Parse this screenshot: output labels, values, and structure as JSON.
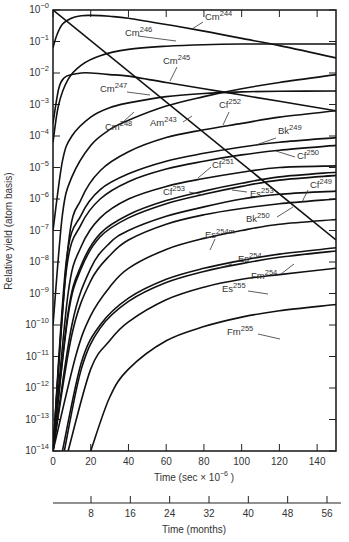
{
  "chart_data": {
    "type": "line",
    "title": "",
    "xlabel": "Time (sec × 10⁻⁶ )",
    "xlabel_parts": {
      "main": "Time (sec × 10",
      "exp": "−6",
      "tail": " )"
    },
    "ylabel": "Relative yield (atom basis)",
    "secondary_xlabel": "Time (months)",
    "yscale": "log",
    "xlim": [
      0,
      150
    ],
    "ylim_log10": [
      -14,
      0
    ],
    "x_ticks": [
      0,
      20,
      40,
      60,
      80,
      100,
      120,
      140
    ],
    "y_ticks_log10": [
      0,
      -1,
      -2,
      -3,
      -4,
      -5,
      -6,
      -7,
      -8,
      -9,
      -10,
      -11,
      -12,
      -13,
      -14
    ],
    "y_tick_labels": [
      "10⁻⁰",
      "10⁻¹",
      "10⁻²",
      "10⁻³",
      "10⁻⁴",
      "10⁻⁵",
      "10⁻⁶",
      "10⁻⁷",
      "10⁻⁸",
      "10⁻⁹",
      "10⁻¹⁰",
      "10⁻¹¹",
      "10⁻¹²",
      "10⁻¹³",
      "10⁻¹⁴"
    ],
    "secondary_x_ticks": [
      8,
      16,
      24,
      32,
      40,
      48,
      56
    ],
    "grid": false,
    "legend": "inline labels",
    "series": [
      {
        "name": "Cm244",
        "label_base": "Cm",
        "label_mass": "244",
        "x": [
          0,
          2,
          5,
          10,
          15,
          20,
          30,
          40,
          60,
          80,
          100,
          120,
          150
        ],
        "log10_y": [
          -1.2,
          -0.8,
          -0.45,
          -0.25,
          -0.18,
          -0.17,
          -0.2,
          -0.26,
          -0.46,
          -0.67,
          -0.9,
          -1.13,
          -1.52
        ],
        "label_pos": [
          205,
          20
        ],
        "leader": [
          [
            203,
            22
          ],
          [
            192,
            29
          ]
        ]
      },
      {
        "name": "Cm246",
        "label_base": "Cm",
        "label_mass": "246",
        "x": [
          0,
          3,
          8,
          15,
          25,
          40,
          60,
          80,
          100,
          120,
          150
        ],
        "log10_y": [
          -4.2,
          -3.0,
          -2.2,
          -1.75,
          -1.45,
          -1.25,
          -1.15,
          -1.1,
          -1.08,
          -1.08,
          -1.08
        ],
        "label_pos": [
          125,
          36
        ],
        "leader": [
          [
            138,
            36
          ],
          [
            176,
            41
          ]
        ]
      },
      {
        "name": "Cm245",
        "label_base": "Cm",
        "label_mass": "245",
        "x": [
          0,
          3,
          6,
          10,
          15,
          20,
          30,
          40,
          60,
          80,
          100,
          120,
          150
        ],
        "log10_y": [
          -3.6,
          -2.5,
          -2.15,
          -2.05,
          -2.0,
          -2.0,
          -2.05,
          -2.1,
          -2.3,
          -2.5,
          -2.7,
          -2.9,
          -3.2
        ],
        "label_pos": [
          163,
          64
        ],
        "leader": [
          [
            177,
            67
          ],
          [
            170,
            81
          ]
        ]
      },
      {
        "name": "Cm247",
        "label_base": "Cm",
        "label_mass": "247",
        "x": [
          0,
          5,
          10,
          20,
          30,
          40,
          60,
          80,
          100,
          120,
          150
        ],
        "log10_y": [
          -7.0,
          -4.8,
          -4.0,
          -3.4,
          -3.1,
          -2.95,
          -2.75,
          -2.65,
          -2.6,
          -2.58,
          -2.57
        ],
        "label_pos": [
          100,
          92
        ],
        "leader": [
          [
            127,
            92
          ],
          [
            150,
            95
          ]
        ]
      },
      {
        "name": "Cm248",
        "label_base": "Cm",
        "label_mass": "248",
        "x": [
          0,
          5,
          10,
          20,
          30,
          40,
          60,
          80,
          100,
          120,
          150
        ],
        "log10_y": [
          -10.0,
          -6.5,
          -5.3,
          -4.3,
          -3.8,
          -3.5,
          -3.05,
          -2.75,
          -2.5,
          -2.3,
          -2.05
        ],
        "label_pos": [
          105,
          130
        ],
        "leader": [
          [
            123,
            122
          ],
          [
            134,
            112
          ]
        ]
      },
      {
        "name": "Am243",
        "label_base": "Am",
        "label_mass": "243",
        "x": [
          0,
          150
        ],
        "log10_y": [
          0.0,
          -7.3
        ],
        "label_pos": [
          150,
          126
        ],
        "leader": [
          [
            183,
            122
          ],
          [
            192,
            116
          ]
        ]
      },
      {
        "name": "Cf252",
        "label_base": "Cf",
        "label_mass": "252",
        "x": [
          0,
          8,
          15,
          25,
          40,
          60,
          80,
          100,
          120,
          150
        ],
        "log10_y": [
          -14,
          -7.5,
          -6.0,
          -5.1,
          -4.5,
          -4.05,
          -3.8,
          -3.6,
          -3.4,
          -3.2
        ],
        "label_pos": [
          219,
          108
        ],
        "leader": [
          [
            229,
            112
          ],
          [
            223,
            125
          ]
        ]
      },
      {
        "name": "Bk249",
        "label_base": "Bk",
        "label_mass": "249",
        "x": [
          0,
          7,
          15,
          25,
          40,
          60,
          80,
          100,
          120,
          150
        ],
        "log10_y": [
          -14,
          -8.0,
          -6.5,
          -5.7,
          -5.2,
          -4.8,
          -4.55,
          -4.35,
          -4.2,
          -4.05
        ],
        "label_pos": [
          278,
          134
        ],
        "leader": [
          [
            276,
            138
          ],
          [
            256,
            145
          ]
        ]
      },
      {
        "name": "Cf250",
        "label_base": "Cf",
        "label_mass": "250",
        "x": [
          0,
          7,
          15,
          25,
          40,
          60,
          80,
          100,
          120,
          150
        ],
        "log10_y": [
          -14,
          -8.3,
          -6.8,
          -6.0,
          -5.45,
          -5.05,
          -4.8,
          -4.6,
          -4.45,
          -4.3
        ],
        "label_pos": [
          297,
          159
        ],
        "leader": [
          [
            295,
            157
          ],
          [
            276,
            151
          ]
        ]
      },
      {
        "name": "Cf251",
        "label_base": "Cf",
        "label_mass": "251",
        "x": [
          0,
          8,
          15,
          25,
          40,
          60,
          80,
          100,
          120,
          150
        ],
        "log10_y": [
          -14,
          -9.0,
          -7.5,
          -6.6,
          -6.0,
          -5.6,
          -5.35,
          -5.15,
          -5.0,
          -4.95
        ],
        "label_pos": [
          212,
          168
        ],
        "leader": [
          [
            211,
            167
          ],
          [
            198,
            178
          ]
        ]
      },
      {
        "name": "Cf253",
        "label_base": "Cf",
        "label_mass": "253",
        "x": [
          0,
          8,
          15,
          25,
          40,
          60,
          80,
          100,
          120,
          150
        ],
        "log10_y": [
          -14,
          -9.6,
          -8.1,
          -7.1,
          -6.5,
          -6.05,
          -5.75,
          -5.5,
          -5.3,
          -5.15
        ],
        "label_pos": [
          163,
          195
        ],
        "leader": [
          [
            189,
            192
          ],
          [
            204,
            195
          ]
        ]
      },
      {
        "name": "Es253",
        "label_base": "Es",
        "label_mass": "253",
        "x": [
          0,
          8,
          15,
          25,
          40,
          60,
          80,
          100,
          120,
          150
        ],
        "log10_y": [
          -14,
          -9.7,
          -8.2,
          -7.2,
          -6.6,
          -6.15,
          -5.85,
          -5.6,
          -5.4,
          -5.25
        ],
        "label_pos": [
          250,
          197
        ],
        "leader": [
          [
            247,
            192
          ],
          [
            232,
            190
          ]
        ]
      },
      {
        "name": "Cf249",
        "label_base": "Cf",
        "label_mass": "249",
        "x": [
          0,
          10,
          20,
          30,
          40,
          60,
          80,
          100,
          120,
          150
        ],
        "log10_y": [
          -14,
          -10.0,
          -8.2,
          -7.4,
          -7.0,
          -6.55,
          -6.25,
          -6.0,
          -5.85,
          -5.75
        ],
        "label_pos": [
          310,
          188
        ],
        "leader": [
          [
            308,
            190
          ],
          [
            302,
            202
          ]
        ]
      },
      {
        "name": "Bk250",
        "label_base": "Bk",
        "label_mass": "250",
        "x": [
          0,
          10,
          20,
          30,
          40,
          60,
          80,
          100,
          120,
          150
        ],
        "log10_y": [
          -14,
          -10.3,
          -8.6,
          -7.8,
          -7.3,
          -6.8,
          -6.5,
          -6.3,
          -6.15,
          -6.0
        ],
        "label_pos": [
          246,
          222
        ],
        "leader": [
          [
            277,
            217
          ],
          [
            293,
            207
          ]
        ]
      },
      {
        "name": "Es254m",
        "label_base": "Es",
        "label_mass": "254m",
        "x": [
          0,
          12,
          20,
          30,
          40,
          60,
          80,
          100,
          120,
          150
        ],
        "log10_y": [
          -14,
          -11.0,
          -9.7,
          -8.8,
          -8.2,
          -7.6,
          -7.25,
          -7.0,
          -6.8,
          -6.65
        ],
        "label_pos": [
          205,
          238
        ],
        "leader": [
          [
            215,
            239
          ],
          [
            210,
            250
          ]
        ]
      },
      {
        "name": "Es254",
        "label_base": "Es",
        "label_mass": "254",
        "x": [
          5,
          15,
          25,
          40,
          60,
          80,
          100,
          120,
          150
        ],
        "log10_y": [
          -14,
          -11.2,
          -10.0,
          -9.15,
          -8.55,
          -8.2,
          -7.95,
          -7.75,
          -7.55
        ],
        "label_pos": [
          238,
          262
        ],
        "leader": [
          [
            232,
            264
          ],
          [
            219,
            268
          ]
        ]
      },
      {
        "name": "Fm254",
        "label_base": "Fm",
        "label_mass": "254",
        "x": [
          6,
          15,
          25,
          40,
          60,
          80,
          100,
          120,
          150
        ],
        "log10_y": [
          -14,
          -11.4,
          -10.1,
          -9.25,
          -8.65,
          -8.3,
          -8.05,
          -7.85,
          -7.65
        ],
        "label_pos": [
          251,
          279
        ],
        "leader": [
          [
            281,
            274
          ],
          [
            294,
            264
          ]
        ]
      },
      {
        "name": "Es255",
        "label_base": "Es",
        "label_mass": "255",
        "x": [
          8,
          20,
          30,
          40,
          60,
          80,
          100,
          120,
          150
        ],
        "log10_y": [
          -14,
          -11.4,
          -10.5,
          -9.9,
          -9.2,
          -8.8,
          -8.55,
          -8.4,
          -8.2
        ],
        "label_pos": [
          222,
          292
        ],
        "leader": [
          [
            248,
            291
          ],
          [
            268,
            294
          ]
        ]
      },
      {
        "name": "Fm255",
        "label_base": "Fm",
        "label_mass": "255",
        "x": [
          20,
          30,
          40,
          60,
          80,
          100,
          120,
          150
        ],
        "log10_y": [
          -14,
          -12.3,
          -11.4,
          -10.5,
          -10.05,
          -9.75,
          -9.55,
          -9.35
        ],
        "label_pos": [
          227,
          335
        ],
        "leader": [
          [
            258,
            334
          ],
          [
            280,
            339
          ]
        ]
      }
    ]
  }
}
